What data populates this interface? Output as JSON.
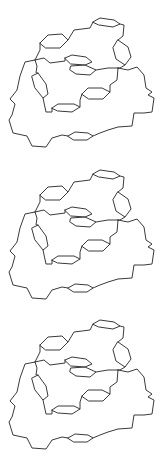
{
  "figure": {
    "stroke_color": "#3a3a3a",
    "background": "#ffffff",
    "panels": [
      {
        "id": "structure-1",
        "offset_y": 0
      },
      {
        "id": "structure-2",
        "offset_y": 152
      },
      {
        "id": "structure-3",
        "offset_y": 302
      }
    ],
    "rings": [
      {
        "name": "top-right-ring",
        "points": [
          [
            93,
            22
          ],
          [
            100,
            18
          ],
          [
            114,
            20
          ],
          [
            120,
            24
          ],
          [
            113,
            27
          ],
          [
            99,
            25
          ]
        ]
      },
      {
        "name": "top-left-ring",
        "points": [
          [
            40,
            43
          ],
          [
            48,
            35
          ],
          [
            62,
            34
          ],
          [
            68,
            40
          ],
          [
            60,
            48
          ],
          [
            46,
            48
          ]
        ]
      },
      {
        "name": "right-vertical-ring",
        "points": [
          [
            118,
            40
          ],
          [
            128,
            47
          ],
          [
            131,
            57
          ],
          [
            125,
            65
          ],
          [
            116,
            59
          ],
          [
            113,
            48
          ]
        ]
      },
      {
        "name": "center-upper-ring",
        "points": [
          [
            65,
            58
          ],
          [
            72,
            55
          ],
          [
            86,
            57
          ],
          [
            92,
            62
          ],
          [
            85,
            65
          ],
          [
            71,
            64
          ]
        ]
      },
      {
        "name": "center-lower-ring",
        "points": [
          [
            71,
            66
          ],
          [
            85,
            65
          ],
          [
            96,
            70
          ],
          [
            90,
            75
          ],
          [
            76,
            74
          ],
          [
            70,
            70
          ]
        ]
      },
      {
        "name": "left-vertical-ring",
        "points": [
          [
            32,
            76
          ],
          [
            38,
            73
          ],
          [
            46,
            84
          ],
          [
            48,
            94
          ],
          [
            43,
            98
          ],
          [
            35,
            88
          ]
        ]
      },
      {
        "name": "middle-ring",
        "points": [
          [
            82,
            94
          ],
          [
            88,
            88
          ],
          [
            102,
            88
          ],
          [
            110,
            92
          ],
          [
            103,
            99
          ],
          [
            89,
            99
          ]
        ]
      },
      {
        "name": "lower-ring",
        "points": [
          [
            52,
            108
          ],
          [
            58,
            104
          ],
          [
            74,
            104
          ],
          [
            80,
            107
          ],
          [
            72,
            112
          ],
          [
            58,
            111
          ]
        ]
      },
      {
        "name": "bottom-ring",
        "points": [
          [
            68,
            136
          ],
          [
            75,
            132
          ],
          [
            88,
            133
          ],
          [
            93,
            136
          ],
          [
            87,
            140
          ],
          [
            74,
            140
          ]
        ]
      }
    ],
    "chains": [
      {
        "name": "top-link",
        "points": [
          [
            68,
            40
          ],
          [
            74,
            30
          ],
          [
            90,
            28
          ],
          [
            93,
            22
          ]
        ]
      },
      {
        "name": "top-right-link",
        "points": [
          [
            120,
            24
          ],
          [
            124,
            25
          ],
          [
            123,
            36
          ],
          [
            118,
            40
          ]
        ]
      },
      {
        "name": "left-node-to-top-left-ring",
        "points": [
          [
            35,
            60
          ],
          [
            40,
            50
          ],
          [
            40,
            43
          ]
        ]
      },
      {
        "name": "left-node-to-center",
        "points": [
          [
            35,
            60
          ],
          [
            44,
            58
          ],
          [
            50,
            63
          ],
          [
            65,
            61
          ],
          [
            65,
            58
          ]
        ]
      },
      {
        "name": "left-node-to-left-ring",
        "points": [
          [
            35,
            60
          ],
          [
            37,
            66
          ],
          [
            36,
            73
          ],
          [
            38,
            73
          ]
        ]
      },
      {
        "name": "center-to-right-node",
        "points": [
          [
            96,
            70
          ],
          [
            108,
            68
          ],
          [
            118,
            68
          ]
        ]
      },
      {
        "name": "right-ring-to-right-node",
        "points": [
          [
            125,
            65
          ],
          [
            120,
            68
          ],
          [
            118,
            68
          ]
        ]
      },
      {
        "name": "right-node-down",
        "points": [
          [
            118,
            68
          ],
          [
            117,
            80
          ],
          [
            110,
            85
          ],
          [
            110,
            92
          ]
        ]
      },
      {
        "name": "left-ring-to-lower",
        "points": [
          [
            43,
            98
          ],
          [
            46,
            112
          ],
          [
            52,
            112
          ],
          [
            52,
            108
          ]
        ]
      },
      {
        "name": "middle-to-lower-ring",
        "points": [
          [
            82,
            94
          ],
          [
            80,
            100
          ],
          [
            80,
            107
          ]
        ]
      },
      {
        "name": "right-outer-loop",
        "points": [
          [
            118,
            68
          ],
          [
            128,
            70
          ],
          [
            137,
            67
          ],
          [
            144,
            75
          ],
          [
            146,
            88
          ],
          [
            152,
            92
          ],
          [
            148,
            95
          ],
          [
            154,
            98
          ],
          [
            152,
            112
          ],
          [
            144,
            113
          ],
          [
            134,
            113
          ],
          [
            132,
            126
          ],
          [
            118,
            127
          ],
          [
            108,
            130
          ],
          [
            100,
            133
          ],
          [
            93,
            136
          ]
        ]
      },
      {
        "name": "left-outer-loop",
        "points": [
          [
            35,
            60
          ],
          [
            25,
            62
          ],
          [
            20,
            76
          ],
          [
            17,
            90
          ],
          [
            10,
            99
          ],
          [
            15,
            104
          ],
          [
            12,
            115
          ],
          [
            9,
            120
          ],
          [
            13,
            133
          ],
          [
            27,
            136
          ],
          [
            32,
            146
          ],
          [
            46,
            147
          ],
          [
            52,
            138
          ],
          [
            62,
            135
          ],
          [
            68,
            136
          ]
        ]
      }
    ]
  }
}
